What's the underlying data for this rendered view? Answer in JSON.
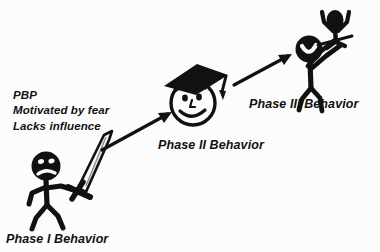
{
  "diagram": {
    "background_color": "#fcfcfc",
    "ink_color": "#111111",
    "annotation": {
      "line1": "PBP",
      "line2": "Motivated by fear",
      "line3": "Lacks influence"
    },
    "nodes": [
      {
        "id": "phase1",
        "label": "Phase I Behavior",
        "figure": "stick-figure-with-sword",
        "expression": "frowning",
        "description": "Angry stick figure holding a raised sword"
      },
      {
        "id": "phase2",
        "label": "Phase II Behavior",
        "figure": "smiley-face-with-graduation-cap",
        "expression": "smiling",
        "description": "Smiling face wearing a graduation cap"
      },
      {
        "id": "phase3",
        "label": "Phase III Behavior",
        "figure": "stick-figure-lifting-person",
        "expression": "celebrating",
        "description": "Stick figure lifting a cheering person overhead"
      }
    ],
    "arrows": [
      {
        "id": "arrow-1-to-2",
        "from": "phase1",
        "to": "phase2",
        "direction": "up-right"
      },
      {
        "id": "arrow-2-to-3",
        "from": "phase2",
        "to": "phase3",
        "direction": "up-right"
      }
    ]
  }
}
